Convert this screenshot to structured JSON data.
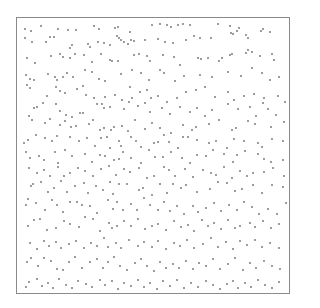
{
  "frame": {
    "x": 16,
    "y": 17,
    "width": 274,
    "height": 277,
    "border_color": "#8a8a8a"
  },
  "dot_color": "#6e6e6e",
  "dot_radius": 0.9,
  "dots": [
    [
      25,
      29
    ],
    [
      31,
      31
    ],
    [
      41,
      26
    ],
    [
      58,
      29
    ],
    [
      68,
      30
    ],
    [
      76,
      30
    ],
    [
      94,
      26
    ],
    [
      99,
      29
    ],
    [
      115,
      28
    ],
    [
      118,
      27
    ],
    [
      130,
      32
    ],
    [
      152,
      25
    ],
    [
      160,
      24
    ],
    [
      167,
      25
    ],
    [
      171,
      27
    ],
    [
      178,
      25
    ],
    [
      183,
      24
    ],
    [
      190,
      25
    ],
    [
      218,
      24
    ],
    [
      230,
      26
    ],
    [
      239,
      28
    ],
    [
      25,
      38
    ],
    [
      32,
      42
    ],
    [
      46,
      42
    ],
    [
      50,
      37
    ],
    [
      54,
      37
    ],
    [
      70,
      48
    ],
    [
      72,
      45
    ],
    [
      88,
      44
    ],
    [
      90,
      47
    ],
    [
      98,
      42
    ],
    [
      104,
      43
    ],
    [
      110,
      45
    ],
    [
      117,
      36
    ],
    [
      119,
      38
    ],
    [
      121,
      40
    ],
    [
      124,
      42
    ],
    [
      128,
      44
    ],
    [
      131,
      40
    ],
    [
      134,
      41
    ],
    [
      145,
      40
    ],
    [
      158,
      39
    ],
    [
      165,
      42
    ],
    [
      173,
      43
    ],
    [
      186,
      40
    ],
    [
      194,
      36
    ],
    [
      200,
      38
    ],
    [
      211,
      38
    ],
    [
      231,
      33
    ],
    [
      233,
      34
    ],
    [
      237,
      31
    ],
    [
      246,
      35
    ],
    [
      248,
      38
    ],
    [
      261,
      31
    ],
    [
      263,
      29
    ],
    [
      270,
      32
    ],
    [
      27,
      58
    ],
    [
      35,
      63
    ],
    [
      51,
      56
    ],
    [
      60,
      54
    ],
    [
      63,
      57
    ],
    [
      70,
      58
    ],
    [
      75,
      54
    ],
    [
      84,
      55
    ],
    [
      92,
      62
    ],
    [
      101,
      54
    ],
    [
      110,
      60
    ],
    [
      112,
      61
    ],
    [
      118,
      61
    ],
    [
      134,
      55
    ],
    [
      139,
      54
    ],
    [
      147,
      56
    ],
    [
      150,
      61
    ],
    [
      163,
      55
    ],
    [
      174,
      57
    ],
    [
      180,
      65
    ],
    [
      198,
      58
    ],
    [
      201,
      59
    ],
    [
      208,
      58
    ],
    [
      219,
      61
    ],
    [
      222,
      58
    ],
    [
      230,
      55
    ],
    [
      232,
      54
    ],
    [
      246,
      53
    ],
    [
      248,
      50
    ],
    [
      252,
      52
    ],
    [
      260,
      56
    ],
    [
      272,
      54
    ],
    [
      274,
      60
    ],
    [
      26,
      75
    ],
    [
      30,
      79
    ],
    [
      34,
      80
    ],
    [
      48,
      74
    ],
    [
      55,
      77
    ],
    [
      57,
      80
    ],
    [
      63,
      77
    ],
    [
      67,
      73
    ],
    [
      73,
      77
    ],
    [
      85,
      70
    ],
    [
      92,
      72
    ],
    [
      99,
      79
    ],
    [
      105,
      81
    ],
    [
      121,
      74
    ],
    [
      132,
      70
    ],
    [
      141,
      73
    ],
    [
      149,
      80
    ],
    [
      160,
      70
    ],
    [
      164,
      73
    ],
    [
      175,
      81
    ],
    [
      184,
      76
    ],
    [
      200,
      75
    ],
    [
      212,
      77
    ],
    [
      228,
      72
    ],
    [
      241,
      76
    ],
    [
      252,
      68
    ],
    [
      262,
      73
    ],
    [
      270,
      80
    ],
    [
      279,
      77
    ],
    [
      27,
      85
    ],
    [
      30,
      88
    ],
    [
      47,
      96
    ],
    [
      56,
      87
    ],
    [
      60,
      91
    ],
    [
      65,
      93
    ],
    [
      77,
      89
    ],
    [
      83,
      86
    ],
    [
      86,
      95
    ],
    [
      94,
      98
    ],
    [
      105,
      97
    ],
    [
      115,
      95
    ],
    [
      122,
      100
    ],
    [
      130,
      87
    ],
    [
      132,
      98
    ],
    [
      140,
      92
    ],
    [
      147,
      90
    ],
    [
      151,
      98
    ],
    [
      158,
      96
    ],
    [
      167,
      102
    ],
    [
      177,
      98
    ],
    [
      186,
      92
    ],
    [
      196,
      90
    ],
    [
      205,
      87
    ],
    [
      215,
      97
    ],
    [
      228,
      92
    ],
    [
      234,
      100
    ],
    [
      244,
      96
    ],
    [
      254,
      94
    ],
    [
      264,
      98
    ],
    [
      278,
      96
    ],
    [
      285,
      102
    ],
    [
      34,
      108
    ],
    [
      37,
      107
    ],
    [
      43,
      103
    ],
    [
      56,
      104
    ],
    [
      60,
      111
    ],
    [
      66,
      115
    ],
    [
      72,
      117
    ],
    [
      80,
      113
    ],
    [
      83,
      113
    ],
    [
      97,
      104
    ],
    [
      102,
      104
    ],
    [
      104,
      108
    ],
    [
      110,
      107
    ],
    [
      124,
      109
    ],
    [
      129,
      102
    ],
    [
      138,
      106
    ],
    [
      145,
      103
    ],
    [
      150,
      112
    ],
    [
      162,
      108
    ],
    [
      170,
      114
    ],
    [
      180,
      107
    ],
    [
      190,
      112
    ],
    [
      197,
      108
    ],
    [
      205,
      116
    ],
    [
      212,
      110
    ],
    [
      228,
      104
    ],
    [
      238,
      109
    ],
    [
      250,
      107
    ],
    [
      256,
      116
    ],
    [
      263,
      103
    ],
    [
      268,
      109
    ],
    [
      276,
      115
    ],
    [
      29,
      116
    ],
    [
      32,
      120
    ],
    [
      45,
      123
    ],
    [
      50,
      119
    ],
    [
      60,
      125
    ],
    [
      65,
      121
    ],
    [
      71,
      127
    ],
    [
      76,
      126
    ],
    [
      89,
      124
    ],
    [
      93,
      120
    ],
    [
      100,
      130
    ],
    [
      104,
      128
    ],
    [
      111,
      130
    ],
    [
      114,
      127
    ],
    [
      122,
      126
    ],
    [
      128,
      131
    ],
    [
      135,
      120
    ],
    [
      145,
      129
    ],
    [
      152,
      123
    ],
    [
      160,
      128
    ],
    [
      171,
      133
    ],
    [
      183,
      125
    ],
    [
      192,
      130
    ],
    [
      196,
      127
    ],
    [
      209,
      124
    ],
    [
      219,
      120
    ],
    [
      232,
      130
    ],
    [
      236,
      128
    ],
    [
      248,
      121
    ],
    [
      255,
      124
    ],
    [
      271,
      127
    ],
    [
      284,
      122
    ],
    [
      24,
      143
    ],
    [
      28,
      140
    ],
    [
      36,
      135
    ],
    [
      45,
      138
    ],
    [
      52,
      141
    ],
    [
      57,
      136
    ],
    [
      70,
      137
    ],
    [
      79,
      141
    ],
    [
      87,
      138
    ],
    [
      95,
      146
    ],
    [
      101,
      138
    ],
    [
      107,
      137
    ],
    [
      110,
      148
    ],
    [
      119,
      141
    ],
    [
      121,
      146
    ],
    [
      131,
      137
    ],
    [
      136,
      141
    ],
    [
      141,
      147
    ],
    [
      154,
      143
    ],
    [
      158,
      142
    ],
    [
      164,
      135
    ],
    [
      169,
      142
    ],
    [
      178,
      148
    ],
    [
      183,
      137
    ],
    [
      188,
      137
    ],
    [
      197,
      140
    ],
    [
      209,
      143
    ],
    [
      216,
      141
    ],
    [
      227,
      148
    ],
    [
      234,
      139
    ],
    [
      244,
      141
    ],
    [
      258,
      143
    ],
    [
      262,
      147
    ],
    [
      272,
      139
    ],
    [
      283,
      141
    ],
    [
      26,
      152
    ],
    [
      30,
      158
    ],
    [
      39,
      156
    ],
    [
      44,
      160
    ],
    [
      55,
      152
    ],
    [
      58,
      163
    ],
    [
      65,
      150
    ],
    [
      72,
      156
    ],
    [
      85,
      154
    ],
    [
      92,
      162
    ],
    [
      100,
      155
    ],
    [
      105,
      156
    ],
    [
      114,
      160
    ],
    [
      119,
      159
    ],
    [
      123,
      152
    ],
    [
      131,
      158
    ],
    [
      141,
      163
    ],
    [
      149,
      150
    ],
    [
      155,
      157
    ],
    [
      163,
      157
    ],
    [
      171,
      152
    ],
    [
      182,
      158
    ],
    [
      190,
      163
    ],
    [
      197,
      155
    ],
    [
      206,
      156
    ],
    [
      213,
      150
    ],
    [
      224,
      154
    ],
    [
      233,
      162
    ],
    [
      237,
      155
    ],
    [
      245,
      151
    ],
    [
      258,
      154
    ],
    [
      264,
      159
    ],
    [
      271,
      162
    ],
    [
      283,
      160
    ],
    [
      29,
      168
    ],
    [
      37,
      173
    ],
    [
      44,
      170
    ],
    [
      50,
      176
    ],
    [
      58,
      167
    ],
    [
      64,
      176
    ],
    [
      70,
      173
    ],
    [
      78,
      168
    ],
    [
      85,
      171
    ],
    [
      93,
      176
    ],
    [
      101,
      169
    ],
    [
      109,
      166
    ],
    [
      116,
      175
    ],
    [
      124,
      169
    ],
    [
      130,
      172
    ],
    [
      139,
      168
    ],
    [
      147,
      178
    ],
    [
      154,
      176
    ],
    [
      164,
      167
    ],
    [
      169,
      170
    ],
    [
      175,
      176
    ],
    [
      185,
      169
    ],
    [
      193,
      177
    ],
    [
      203,
      170
    ],
    [
      211,
      173
    ],
    [
      216,
      175
    ],
    [
      224,
      167
    ],
    [
      232,
      178
    ],
    [
      240,
      171
    ],
    [
      247,
      176
    ],
    [
      253,
      173
    ],
    [
      264,
      172
    ],
    [
      273,
      168
    ],
    [
      284,
      176
    ],
    [
      31,
      186
    ],
    [
      33,
      184
    ],
    [
      41,
      182
    ],
    [
      48,
      192
    ],
    [
      54,
      188
    ],
    [
      61,
      181
    ],
    [
      67,
      192
    ],
    [
      75,
      186
    ],
    [
      84,
      183
    ],
    [
      88,
      193
    ],
    [
      96,
      186
    ],
    [
      103,
      190
    ],
    [
      110,
      182
    ],
    [
      113,
      194
    ],
    [
      119,
      184
    ],
    [
      127,
      184
    ],
    [
      139,
      190
    ],
    [
      143,
      188
    ],
    [
      152,
      195
    ],
    [
      160,
      184
    ],
    [
      167,
      193
    ],
    [
      173,
      184
    ],
    [
      181,
      188
    ],
    [
      186,
      185
    ],
    [
      197,
      192
    ],
    [
      210,
      189
    ],
    [
      218,
      182
    ],
    [
      227,
      183
    ],
    [
      235,
      191
    ],
    [
      242,
      189
    ],
    [
      253,
      185
    ],
    [
      262,
      193
    ],
    [
      272,
      185
    ],
    [
      283,
      187
    ],
    [
      26,
      205
    ],
    [
      28,
      199
    ],
    [
      36,
      203
    ],
    [
      45,
      210
    ],
    [
      52,
      200
    ],
    [
      57,
      205
    ],
    [
      63,
      212
    ],
    [
      70,
      202
    ],
    [
      77,
      202
    ],
    [
      82,
      205
    ],
    [
      90,
      206
    ],
    [
      97,
      213
    ],
    [
      108,
      200
    ],
    [
      113,
      209
    ],
    [
      117,
      202
    ],
    [
      123,
      210
    ],
    [
      131,
      204
    ],
    [
      137,
      210
    ],
    [
      144,
      198
    ],
    [
      150,
      205
    ],
    [
      158,
      210
    ],
    [
      164,
      202
    ],
    [
      170,
      211
    ],
    [
      177,
      206
    ],
    [
      184,
      214
    ],
    [
      193,
      206
    ],
    [
      198,
      212
    ],
    [
      206,
      208
    ],
    [
      214,
      203
    ],
    [
      221,
      211
    ],
    [
      229,
      205
    ],
    [
      237,
      210
    ],
    [
      244,
      202
    ],
    [
      252,
      207
    ],
    [
      259,
      214
    ],
    [
      268,
      209
    ],
    [
      277,
      214
    ],
    [
      286,
      203
    ],
    [
      28,
      226
    ],
    [
      34,
      220
    ],
    [
      40,
      219
    ],
    [
      47,
      230
    ],
    [
      56,
      228
    ],
    [
      64,
      221
    ],
    [
      70,
      224
    ],
    [
      79,
      227
    ],
    [
      85,
      217
    ],
    [
      93,
      219
    ],
    [
      100,
      231
    ],
    [
      109,
      223
    ],
    [
      112,
      228
    ],
    [
      117,
      226
    ],
    [
      124,
      221
    ],
    [
      131,
      226
    ],
    [
      138,
      219
    ],
    [
      145,
      229
    ],
    [
      152,
      226
    ],
    [
      158,
      224
    ],
    [
      166,
      230
    ],
    [
      174,
      221
    ],
    [
      181,
      227
    ],
    [
      188,
      225
    ],
    [
      194,
      231
    ],
    [
      202,
      220
    ],
    [
      208,
      226
    ],
    [
      214,
      223
    ],
    [
      221,
      229
    ],
    [
      228,
      220
    ],
    [
      235,
      228
    ],
    [
      240,
      226
    ],
    [
      250,
      223
    ],
    [
      255,
      227
    ],
    [
      263,
      221
    ],
    [
      271,
      228
    ],
    [
      279,
      224
    ],
    [
      30,
      243
    ],
    [
      37,
      249
    ],
    [
      44,
      241
    ],
    [
      49,
      246
    ],
    [
      56,
      242
    ],
    [
      61,
      248
    ],
    [
      69,
      244
    ],
    [
      76,
      241
    ],
    [
      84,
      248
    ],
    [
      91,
      243
    ],
    [
      97,
      246
    ],
    [
      104,
      238
    ],
    [
      108,
      247
    ],
    [
      116,
      243
    ],
    [
      121,
      248
    ],
    [
      129,
      240
    ],
    [
      138,
      246
    ],
    [
      144,
      242
    ],
    [
      152,
      247
    ],
    [
      158,
      241
    ],
    [
      166,
      249
    ],
    [
      174,
      243
    ],
    [
      180,
      246
    ],
    [
      187,
      240
    ],
    [
      194,
      248
    ],
    [
      203,
      244
    ],
    [
      211,
      238
    ],
    [
      218,
      247
    ],
    [
      226,
      242
    ],
    [
      233,
      249
    ],
    [
      240,
      241
    ],
    [
      247,
      245
    ],
    [
      255,
      240
    ],
    [
      262,
      247
    ],
    [
      270,
      243
    ],
    [
      279,
      248
    ],
    [
      27,
      262
    ],
    [
      31,
      258
    ],
    [
      38,
      266
    ],
    [
      44,
      258
    ],
    [
      51,
      261
    ],
    [
      57,
      269
    ],
    [
      63,
      270
    ],
    [
      69,
      262
    ],
    [
      75,
      257
    ],
    [
      82,
      268
    ],
    [
      90,
      262
    ],
    [
      97,
      259
    ],
    [
      103,
      268
    ],
    [
      108,
      262
    ],
    [
      114,
      257
    ],
    [
      120,
      266
    ],
    [
      127,
      270
    ],
    [
      135,
      263
    ],
    [
      141,
      259
    ],
    [
      147,
      266
    ],
    [
      154,
      271
    ],
    [
      160,
      262
    ],
    [
      166,
      268
    ],
    [
      173,
      264
    ],
    [
      179,
      268
    ],
    [
      186,
      261
    ],
    [
      193,
      269
    ],
    [
      199,
      263
    ],
    [
      206,
      266
    ],
    [
      213,
      259
    ],
    [
      220,
      269
    ],
    [
      228,
      264
    ],
    [
      235,
      258
    ],
    [
      243,
      270
    ],
    [
      250,
      263
    ],
    [
      256,
      268
    ],
    [
      264,
      261
    ],
    [
      272,
      266
    ],
    [
      280,
      269
    ],
    [
      26,
      287
    ],
    [
      29,
      282
    ],
    [
      37,
      279
    ],
    [
      42,
      286
    ],
    [
      48,
      283
    ],
    [
      53,
      288
    ],
    [
      59,
      279
    ],
    [
      66,
      285
    ],
    [
      72,
      288
    ],
    [
      78,
      281
    ],
    [
      86,
      284
    ],
    [
      92,
      287
    ],
    [
      100,
      280
    ],
    [
      105,
      285
    ],
    [
      112,
      281
    ],
    [
      118,
      289
    ],
    [
      124,
      283
    ],
    [
      131,
      286
    ],
    [
      138,
      280
    ],
    [
      144,
      287
    ],
    [
      150,
      283
    ],
    [
      157,
      289
    ],
    [
      163,
      281
    ],
    [
      170,
      286
    ],
    [
      177,
      280
    ],
    [
      184,
      288
    ],
    [
      191,
      283
    ],
    [
      198,
      287
    ],
    [
      206,
      281
    ],
    [
      213,
      285
    ],
    [
      220,
      289
    ],
    [
      227,
      284
    ],
    [
      233,
      281
    ],
    [
      238,
      288
    ],
    [
      245,
      283
    ],
    [
      251,
      287
    ],
    [
      258,
      280
    ],
    [
      265,
      285
    ],
    [
      272,
      288
    ],
    [
      279,
      282
    ]
  ]
}
